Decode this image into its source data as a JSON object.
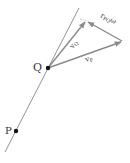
{
  "diagram": {
    "points": {
      "Q": {
        "label": "Q"
      },
      "P": {
        "label": "P"
      }
    },
    "vectors": {
      "vQ": {
        "label": "v",
        "sub": "Q"
      },
      "vP": {
        "label": "v",
        "sub": "P"
      },
      "rPQw": {
        "label": "r",
        "sub": "PQ",
        "suffix": "ω"
      }
    },
    "colors": {
      "line": "#777777",
      "vector": "#8a8a8a",
      "point": "#111111",
      "text": "#333333"
    }
  }
}
